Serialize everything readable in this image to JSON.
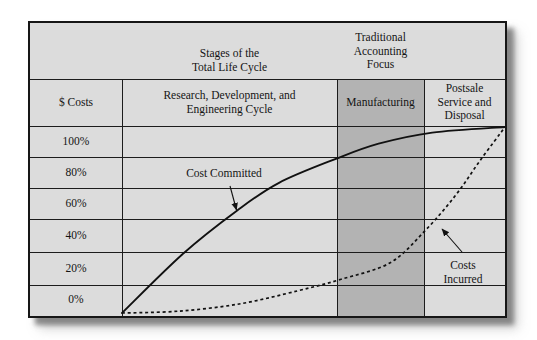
{
  "figure": {
    "top_header": {
      "stages_label": "Stages of the\nTotal Life Cycle",
      "focus_label": "Traditional\nAccounting\nFocus"
    },
    "columns": [
      {
        "label": "$ Costs"
      },
      {
        "label": "Research, Development, and\nEngineering Cycle"
      },
      {
        "label": "Manufacturing",
        "shaded": true
      },
      {
        "label": "Postsale\nService and\nDisposal"
      }
    ],
    "row_labels": [
      "100%",
      "80%",
      "60%",
      "40%",
      "20%",
      "0%"
    ],
    "annotations": {
      "cost_committed": "Cost Committed",
      "costs_incurred": "Costs\nIncurred"
    },
    "colors": {
      "panel_background": "#dcdcdc",
      "manufacturing_shading": "#b3b3b3",
      "line_color": "#1c1c1c",
      "text_color": "#141414",
      "curve_color": "#111111"
    }
  },
  "chart_data": {
    "type": "line",
    "title": "Stages of the Total Life Cycle",
    "ylabel": "$ Costs",
    "y_ticks": [
      "100%",
      "80%",
      "60%",
      "40%",
      "20%",
      "0%"
    ],
    "ylim": [
      0,
      100
    ],
    "x_stages": [
      "Research, Development, and Engineering Cycle",
      "Manufacturing",
      "Postsale Service and Disposal"
    ],
    "traditional_accounting_focus_stage": "Manufacturing",
    "grid": true,
    "legend_position": "inline-annotations",
    "series": [
      {
        "name": "Cost Committed",
        "style": "solid",
        "x_fraction": [
          0,
          0.16,
          0.3,
          0.41,
          0.56,
          0.67,
          0.81,
          1.0
        ],
        "values_pct": [
          0,
          32,
          55,
          70,
          83,
          91,
          97,
          100
        ]
      },
      {
        "name": "Costs Incurred",
        "style": "dashed",
        "x_fraction": [
          0,
          0.15,
          0.31,
          0.46,
          0.57,
          0.7,
          0.79,
          0.87,
          0.935,
          1.0
        ],
        "values_pct": [
          0,
          1,
          5,
          12,
          18,
          27,
          44,
          63,
          82,
          100
        ]
      }
    ]
  }
}
